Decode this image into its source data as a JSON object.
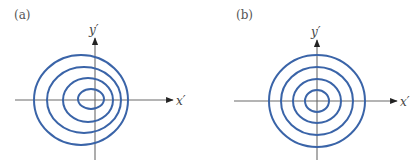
{
  "figure": {
    "colors": {
      "contour": "#3a64a8",
      "axis": "#6a6a6a",
      "background": "#ffffff"
    },
    "panels": [
      {
        "id": "a",
        "label": "(a)",
        "x_axis_label": "x′",
        "y_axis_label": "y′",
        "description": "Concentric-like elliptical contours shifted left of the y' axis",
        "axes": {
          "origin": [
            95,
            100
          ],
          "x_from": 15,
          "x_to": 173,
          "y_from": 160,
          "y_to": 38
        },
        "contours": [
          {
            "cx": 81,
            "cy": 100,
            "rx": 47,
            "ry": 45
          },
          {
            "cx": 84,
            "cy": 100,
            "rx": 37,
            "ry": 33
          },
          {
            "cx": 88,
            "cy": 100,
            "rx": 25,
            "ry": 22
          },
          {
            "cx": 91,
            "cy": 99,
            "rx": 13,
            "ry": 10
          }
        ]
      },
      {
        "id": "b",
        "label": "(b)",
        "x_axis_label": "x′",
        "y_axis_label": "y′",
        "description": "Concentric circular contours centered at the origin",
        "axes": {
          "origin": [
            317,
            101
          ],
          "x_from": 234,
          "x_to": 397,
          "y_from": 160,
          "y_to": 40
        },
        "contours": [
          {
            "cx": 317,
            "cy": 101,
            "rx": 48,
            "ry": 46
          },
          {
            "cx": 317,
            "cy": 101,
            "rx": 36,
            "ry": 34
          },
          {
            "cx": 317,
            "cy": 101,
            "rx": 24,
            "ry": 22
          },
          {
            "cx": 317,
            "cy": 101,
            "rx": 12,
            "ry": 11
          }
        ]
      }
    ]
  }
}
